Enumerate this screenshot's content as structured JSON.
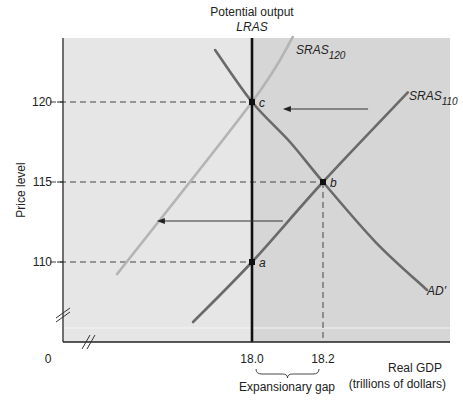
{
  "chart_data": {
    "type": "line",
    "title": "",
    "header_label": "Potential output",
    "xlabel": "Real GDP",
    "xlabel_units": "(trillions of dollars)",
    "ylabel": "Price level",
    "origin_label": "0",
    "xlim": [
      17.47,
      18.56
    ],
    "ylim": [
      105.5,
      124.0
    ],
    "x_ticks": [
      {
        "value": 18.0,
        "label": "18.0"
      },
      {
        "value": 18.2,
        "label": "18.2"
      }
    ],
    "y_ticks": [
      {
        "value": 110,
        "label": "110"
      },
      {
        "value": 115,
        "label": "115"
      },
      {
        "value": 120,
        "label": "120"
      }
    ],
    "axis_breaks": true,
    "grid": false,
    "shaded_regions": [
      {
        "name": "left-of-potential",
        "x_from": 17.47,
        "x_to": 18.0,
        "color": "#e6e6e6"
      },
      {
        "name": "right-of-potential",
        "x_from": 18.0,
        "x_to": 18.56,
        "color": "#d6d6d6"
      }
    ],
    "series": [
      {
        "name": "LRAS",
        "label": "LRAS",
        "kind": "vertical",
        "x": 18.0,
        "color": "#111111"
      },
      {
        "name": "AD'",
        "label": "AD'",
        "color": "#6a6a6a",
        "points": [
          [
            17.896,
            123.25
          ],
          [
            18.0,
            120.0
          ],
          [
            18.107,
            117.5
          ],
          [
            18.2,
            115.0
          ],
          [
            18.35,
            111.2
          ],
          [
            18.493,
            108.25
          ]
        ]
      },
      {
        "name": "SRAS110",
        "label_main": "SRAS",
        "label_sub": "110",
        "color": "#6a6a6a",
        "points": [
          [
            17.834,
            106.25
          ],
          [
            18.0,
            110.0
          ],
          [
            18.2,
            115.0
          ],
          [
            18.439,
            120.6
          ]
        ]
      },
      {
        "name": "SRAS120",
        "label_main": "SRAS",
        "label_sub": "120",
        "color": "#b4b4b4",
        "points": [
          [
            17.62,
            109.25
          ],
          [
            18.0,
            120.0
          ],
          [
            18.115,
            124.06
          ]
        ]
      }
    ],
    "points": [
      {
        "label": "a",
        "x": 18.0,
        "y": 110
      },
      {
        "label": "b",
        "x": 18.2,
        "y": 115
      },
      {
        "label": "c",
        "x": 18.0,
        "y": 120
      }
    ],
    "reference_lines": [
      {
        "kind": "h",
        "y": 120,
        "x_to": 18.0
      },
      {
        "kind": "h",
        "y": 115,
        "x_to": 18.2
      },
      {
        "kind": "h",
        "y": 110,
        "x_to": 18.0
      },
      {
        "kind": "v",
        "x": 18.2,
        "y_to": 115
      }
    ],
    "arrows": [
      {
        "from": [
          18.327,
          119.56
        ],
        "to": [
          18.087,
          119.56
        ],
        "meaning": "shift toward c"
      },
      {
        "from": [
          18.087,
          112.56
        ],
        "to": [
          17.732,
          112.56
        ],
        "meaning": "SRAS shifts left"
      }
    ],
    "annotations": [
      {
        "text": "Expansionary gap",
        "bracket_from": 18.0,
        "bracket_to": 18.2
      }
    ]
  }
}
